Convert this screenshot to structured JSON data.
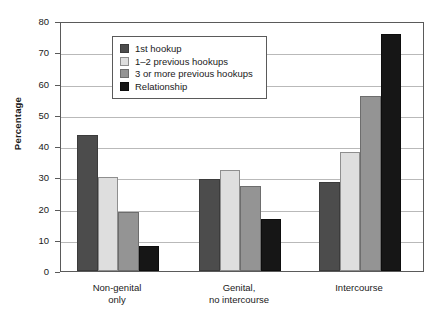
{
  "chart_data": {
    "type": "bar",
    "title": "",
    "xlabel": "",
    "ylabel": "Percentage",
    "ylim": [
      0,
      80
    ],
    "ytick_values": [
      0,
      10,
      20,
      30,
      40,
      50,
      60,
      70,
      80
    ],
    "ytick_labels": [
      "0",
      "10",
      "20",
      "30",
      "40",
      "50",
      "60",
      "70",
      "80"
    ],
    "grid": true,
    "legend_position": "upper-left-inside",
    "categories": [
      "Non-genital only",
      "Genital, no intercourse",
      "Intercourse"
    ],
    "category_lines": [
      [
        "Non-genital",
        "only"
      ],
      [
        "Genital,",
        "no intercourse"
      ],
      [
        "Intercourse",
        ""
      ]
    ],
    "series": [
      {
        "name": "1st hookup",
        "color": "#4c4c4c",
        "values": [
          43.5,
          29.5,
          28.5
        ]
      },
      {
        "name": "1–2 previous hookups",
        "color": "#dedede",
        "values": [
          30.2,
          32.2,
          38.2
        ]
      },
      {
        "name": "3 or more previous hookups",
        "color": "#949494",
        "values": [
          19.0,
          27.2,
          56.0
        ]
      },
      {
        "name": "Relationship",
        "color": "#161616",
        "values": [
          8.0,
          16.8,
          76.0
        ]
      }
    ]
  },
  "legend": {
    "items": [
      {
        "label": "1st hookup"
      },
      {
        "label": "1–2 previous hookups"
      },
      {
        "label": "3 or more previous hookups"
      },
      {
        "label": "Relationship"
      }
    ]
  },
  "axes": {
    "y_title": "Percentage"
  }
}
